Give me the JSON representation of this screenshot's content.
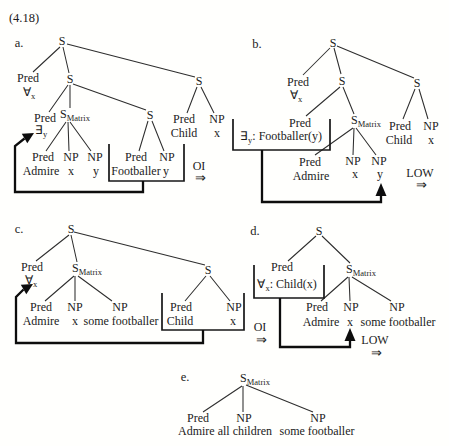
{
  "figure_label": "(4.18)",
  "v": {
    "s": "S",
    "matrix": "Matrix",
    "pred": "Pred",
    "np": "NP",
    "forall": "∀",
    "exists": "∃",
    "x": "x",
    "y": "y",
    "admire": "Admire",
    "footballer": "Footballer",
    "child": "Child",
    "some_footballer": "some footballer",
    "admire_all_children": "Admire all children"
  },
  "ops": {
    "oi": "OI",
    "low": "LOW",
    "arrow": "⇒"
  },
  "panels": {
    "a": {
      "label": "a."
    },
    "b": {
      "label": "b.",
      "box_rest": ": Footballer(y)"
    },
    "c": {
      "label": "c."
    },
    "d": {
      "label": "d.",
      "box_rest": ": Child(x)"
    },
    "e": {
      "label": "e."
    }
  }
}
